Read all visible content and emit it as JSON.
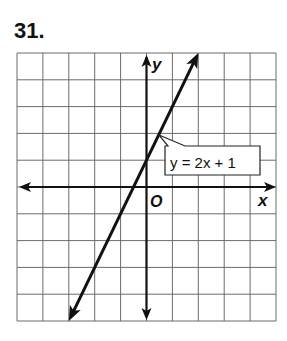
{
  "problem": {
    "number": "31."
  },
  "chart_data": {
    "type": "line",
    "title": "",
    "xlabel": "x",
    "ylabel": "y",
    "origin_label": "O",
    "xlim": [
      -5,
      5
    ],
    "ylim": [
      -5,
      5
    ],
    "grid": true,
    "grid_step": 1,
    "series": [
      {
        "name": "y = 2x + 1",
        "slope": 2,
        "intercept": 1,
        "x": [
          -3,
          -1,
          -0.5,
          0,
          1,
          2
        ],
        "y": [
          -5,
          -1,
          0,
          1,
          3,
          5
        ]
      }
    ],
    "annotations": [
      {
        "text": "y = 2x + 1",
        "points_to": [
          0.6,
          2.2
        ]
      }
    ]
  },
  "colors": {
    "grid": "#6b6b6b",
    "axis": "#111111",
    "line": "#111111",
    "background": "#ffffff"
  }
}
